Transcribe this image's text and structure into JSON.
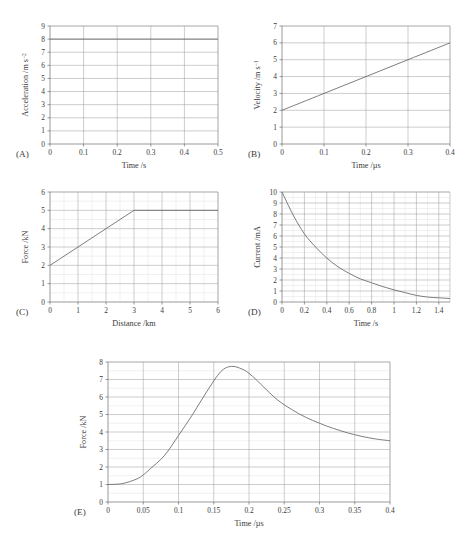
{
  "figure": {
    "panel_count": 5,
    "background": "#ffffff",
    "grid_color_major": "#9a9a9a",
    "grid_color_minor": "#dcdcdc",
    "axis_color": "#6d6d6d",
    "curve_color": "#666666"
  },
  "panels": [
    {
      "letter": "(A)",
      "chart_data": {
        "type": "line",
        "title": "",
        "xlabel": "Time /s",
        "ylabel": "Acceleration /m s",
        "ylabel_sup": "−2",
        "xlim": [
          0,
          0.5
        ],
        "ylim": [
          0,
          9
        ],
        "xticks": [
          "0",
          "0.1",
          "0.2",
          "0.3",
          "0.4",
          "0.5"
        ],
        "xtick_values": [
          0,
          0.1,
          0.2,
          0.3,
          0.4,
          0.5
        ],
        "yticks": [
          "0",
          "1",
          "2",
          "3",
          "4",
          "5",
          "6",
          "7",
          "8",
          "9"
        ],
        "ytick_values": [
          0,
          1,
          2,
          3,
          4,
          5,
          6,
          7,
          8,
          9
        ],
        "grid": "major",
        "legend": "none",
        "series": [
          {
            "name": "acceleration",
            "description": "constant acceleration",
            "x": [
              0,
              0.5
            ],
            "values": [
              8,
              8
            ]
          }
        ]
      }
    },
    {
      "letter": "(B)",
      "chart_data": {
        "type": "line",
        "title": "",
        "xlabel": "Time /µs",
        "ylabel": "Velocity /m s",
        "ylabel_sup": "−1",
        "xlim": [
          0,
          0.4
        ],
        "ylim": [
          0,
          7
        ],
        "xticks": [
          "0",
          "0.1",
          "0.2",
          "0.3",
          "0.4"
        ],
        "xtick_values": [
          0,
          0.1,
          0.2,
          0.3,
          0.4
        ],
        "yticks": [
          "0",
          "1",
          "2",
          "3",
          "4",
          "5",
          "6",
          "7"
        ],
        "ytick_values": [
          0,
          1,
          2,
          3,
          4,
          5,
          6,
          7
        ],
        "grid": "major",
        "legend": "none",
        "series": [
          {
            "name": "velocity",
            "description": "uniform increase from 2 to 6",
            "x": [
              0,
              0.1,
              0.2,
              0.3,
              0.4
            ],
            "values": [
              2,
              3,
              4,
              5,
              6
            ]
          }
        ]
      }
    },
    {
      "letter": "(C)",
      "chart_data": {
        "type": "line",
        "title": "",
        "xlabel": "Distance /km",
        "ylabel": "Force /kN",
        "ylabel_sup": "",
        "xlim": [
          0,
          6
        ],
        "ylim": [
          0,
          6
        ],
        "xticks": [
          "0",
          "1",
          "2",
          "3",
          "4",
          "5",
          "6"
        ],
        "xtick_values": [
          0,
          1,
          2,
          3,
          4,
          5,
          6
        ],
        "yticks": [
          "0",
          "1",
          "2",
          "3",
          "4",
          "5",
          "6"
        ],
        "ytick_values": [
          0,
          1,
          2,
          3,
          4,
          5,
          6
        ],
        "grid": "major+minor",
        "legend": "none",
        "series": [
          {
            "name": "force",
            "description": "linear rise from 2 to 5 then constant",
            "x": [
              0,
              1,
              2,
              3,
              4,
              5,
              6
            ],
            "values": [
              2,
              3,
              4,
              5,
              5,
              5,
              5
            ]
          }
        ]
      }
    },
    {
      "letter": "(D)",
      "chart_data": {
        "type": "line",
        "title": "",
        "xlabel": "Time /s",
        "ylabel": "Current /mA",
        "ylabel_sup": "",
        "xlim": [
          0,
          1.5
        ],
        "ylim": [
          0,
          10
        ],
        "xticks": [
          "0",
          "0.2",
          "0.4",
          "0.6",
          "0.8",
          "1",
          "1.2",
          "1.4"
        ],
        "xtick_values": [
          0,
          0.2,
          0.4,
          0.6,
          0.8,
          1,
          1.2,
          1.4
        ],
        "yticks": [
          "0",
          "1",
          "2",
          "3",
          "4",
          "5",
          "6",
          "7",
          "8",
          "9",
          "10"
        ],
        "ytick_values": [
          0,
          1,
          2,
          3,
          4,
          5,
          6,
          7,
          8,
          9,
          10
        ],
        "grid": "major+minor",
        "legend": "none",
        "series": [
          {
            "name": "current",
            "description": "exponential decay from 10 mA",
            "x": [
              0,
              0.1,
              0.2,
              0.3,
              0.4,
              0.5,
              0.6,
              0.7,
              0.8,
              0.9,
              1.0,
              1.1,
              1.2,
              1.3,
              1.4,
              1.5
            ],
            "values": [
              10,
              7.9,
              6.2,
              5.0,
              4.0,
              3.2,
              2.6,
              2.1,
              1.75,
              1.4,
              1.1,
              0.85,
              0.6,
              0.45,
              0.38,
              0.32
            ]
          }
        ]
      }
    },
    {
      "letter": "(E)",
      "chart_data": {
        "type": "line",
        "title": "",
        "xlabel": "Time /µs",
        "ylabel": "Force /kN",
        "ylabel_sup": "",
        "xlim": [
          0,
          0.4
        ],
        "ylim": [
          0,
          8
        ],
        "xticks": [
          "0",
          "0.05",
          "0.1",
          "0.15",
          "0.2",
          "0.25",
          "0.3",
          "0.35",
          "0.4"
        ],
        "xtick_values": [
          0,
          0.05,
          0.1,
          0.15,
          0.2,
          0.25,
          0.3,
          0.35,
          0.4
        ],
        "yticks": [
          "0",
          "1",
          "2",
          "3",
          "4",
          "5",
          "6",
          "7",
          "8"
        ],
        "ytick_values": [
          0,
          1,
          2,
          3,
          4,
          5,
          6,
          7,
          8
        ],
        "grid": "major+minor",
        "legend": "none",
        "series": [
          {
            "name": "force",
            "description": "flat at 1, rises to peak 7.75 near 0.175, then decays to 3.5",
            "x": [
              0,
              0.02,
              0.04,
              0.05,
              0.06,
              0.08,
              0.1,
              0.12,
              0.14,
              0.16,
              0.175,
              0.19,
              0.2,
              0.21,
              0.22,
              0.24,
              0.26,
              0.28,
              0.3,
              0.32,
              0.34,
              0.36,
              0.38,
              0.4
            ],
            "values": [
              1.0,
              1.05,
              1.3,
              1.55,
              1.9,
              2.65,
              3.8,
              5.0,
              6.3,
              7.45,
              7.75,
              7.6,
              7.35,
              7.0,
              6.6,
              5.85,
              5.3,
              4.85,
              4.5,
              4.2,
              3.95,
              3.75,
              3.6,
              3.5
            ]
          }
        ]
      }
    }
  ]
}
